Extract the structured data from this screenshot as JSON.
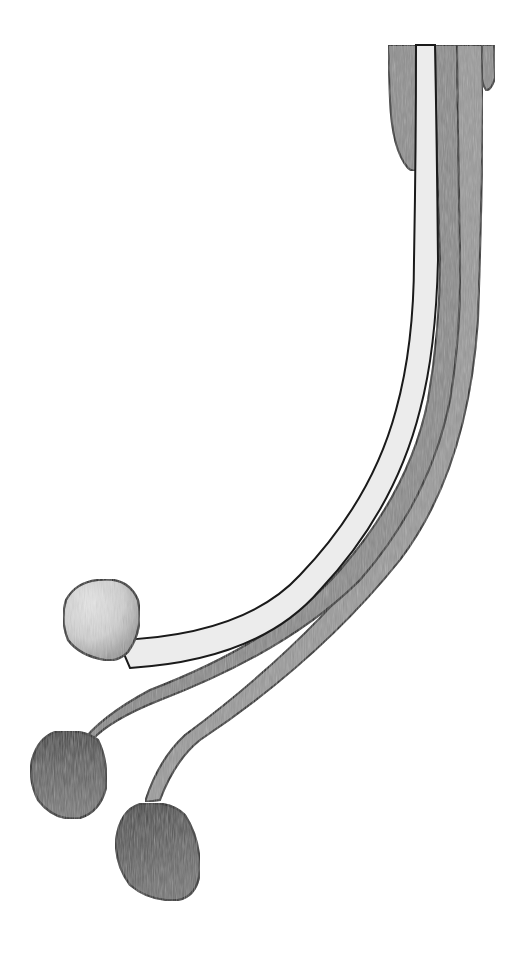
{
  "image": {
    "description": "Pencil drawing of three slender mushroom stalks (one pale, two grey) curving down-left from a cluster at top right, ending in round caps.",
    "width": 529,
    "height": 954,
    "colors": {
      "background": "#ffffff",
      "outline": "#1a1a1a",
      "pale_stalk": "#ececec",
      "dark_stalk": "#8a8a8a",
      "mid_stalk": "#9a9a9a",
      "top_cluster": "#8e8e8e",
      "pale_cap": "#d4d4d4",
      "dark_cap": "#6a6a6a"
    },
    "elements": [
      {
        "name": "pale-stalk",
        "tone": "light"
      },
      {
        "name": "middle-stalk",
        "tone": "dark"
      },
      {
        "name": "right-stalk",
        "tone": "dark"
      },
      {
        "name": "pale-cap",
        "tone": "light"
      },
      {
        "name": "middle-cap",
        "tone": "dark"
      },
      {
        "name": "bottom-cap",
        "tone": "dark"
      }
    ]
  }
}
